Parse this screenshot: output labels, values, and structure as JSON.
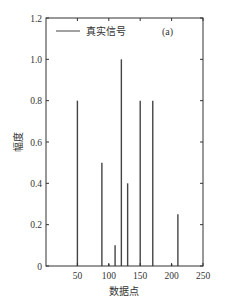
{
  "chart_data": {
    "type": "bar",
    "subtype": "stem",
    "panel_label": "(a)",
    "title": "",
    "xlabel": "数据点",
    "ylabel": "幅度",
    "xlim": [
      0,
      250
    ],
    "ylim": [
      0,
      1.2
    ],
    "xticks": [
      50,
      100,
      150,
      200,
      250
    ],
    "yticks": [
      0,
      0.2,
      0.4,
      0.6,
      0.8,
      1.0,
      1.2
    ],
    "ytick_labels": [
      "0",
      "0.2",
      "0.4",
      "0.6",
      "0.8",
      "1.0",
      "1.2"
    ],
    "grid": false,
    "legend": {
      "position": "upper-left",
      "entries": [
        "真实信号"
      ]
    },
    "series": [
      {
        "name": "真实信号",
        "color": "#444444",
        "x": [
          50,
          89,
          100,
          110,
          120,
          130,
          150,
          170,
          200,
          210
        ],
        "values": [
          0.8,
          0.5,
          0.01,
          0.1,
          1.0,
          0.4,
          0.8,
          0.8,
          0.01,
          0.25
        ]
      }
    ]
  }
}
